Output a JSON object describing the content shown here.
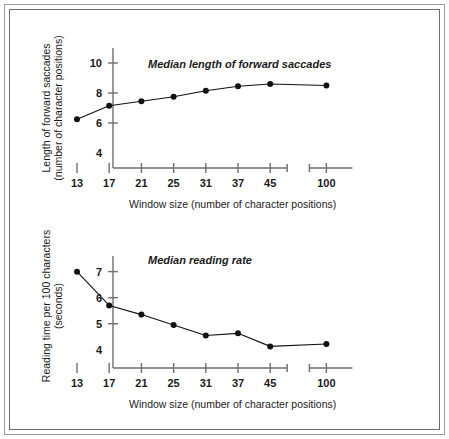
{
  "figure": {
    "border_color": "#6d6d6d",
    "background": "#ffffff",
    "line_color": "#111111",
    "axis_color": "#6f6f6f"
  },
  "shared": {
    "xlabel": "Window size (number of character positions)",
    "x_categories": [
      "13",
      "17",
      "21",
      "25",
      "31",
      "37",
      "45",
      "100"
    ],
    "axis_break": true,
    "axis_break_after": "45"
  },
  "chart_data": [
    {
      "type": "line",
      "name": "median-length-of-forward-saccades",
      "title": "Median length of forward saccades",
      "xlabel": "Window size (number of character positions)",
      "ylabel": "Length of forward saccades (number of character positions)",
      "ylabel_line1": "Length of forward saccades",
      "ylabel_line2": "(number of character positions)",
      "categories": [
        "13",
        "17",
        "21",
        "25",
        "31",
        "37",
        "45",
        "100"
      ],
      "values": [
        6.25,
        7.15,
        7.45,
        7.75,
        8.15,
        8.45,
        8.6,
        8.5
      ],
      "yticks": [
        4,
        6,
        8,
        10
      ],
      "ytick_labels": [
        "4",
        "6",
        "8",
        "10"
      ],
      "ylim": [
        3.0,
        11.0
      ],
      "grid": false,
      "legend": "none",
      "markers": "filled-circle"
    },
    {
      "type": "line",
      "name": "median-reading-rate",
      "title": "Median reading rate",
      "xlabel": "Window size (number of character positions)",
      "ylabel": "Reading time per 100 characters (seconds)",
      "ylabel_line1": "Reading time per 100 characters",
      "ylabel_line2": "(seconds)",
      "categories": [
        "13",
        "17",
        "21",
        "25",
        "31",
        "37",
        "45",
        "100"
      ],
      "values": [
        7.0,
        5.7,
        5.35,
        4.95,
        4.55,
        4.63,
        4.13,
        4.22
      ],
      "yticks": [
        4,
        5,
        6,
        7
      ],
      "ytick_labels": [
        "4",
        "5",
        "6",
        "7"
      ],
      "ylim": [
        3.3,
        7.6
      ],
      "grid": false,
      "legend": "none",
      "markers": "filled-circle"
    }
  ]
}
